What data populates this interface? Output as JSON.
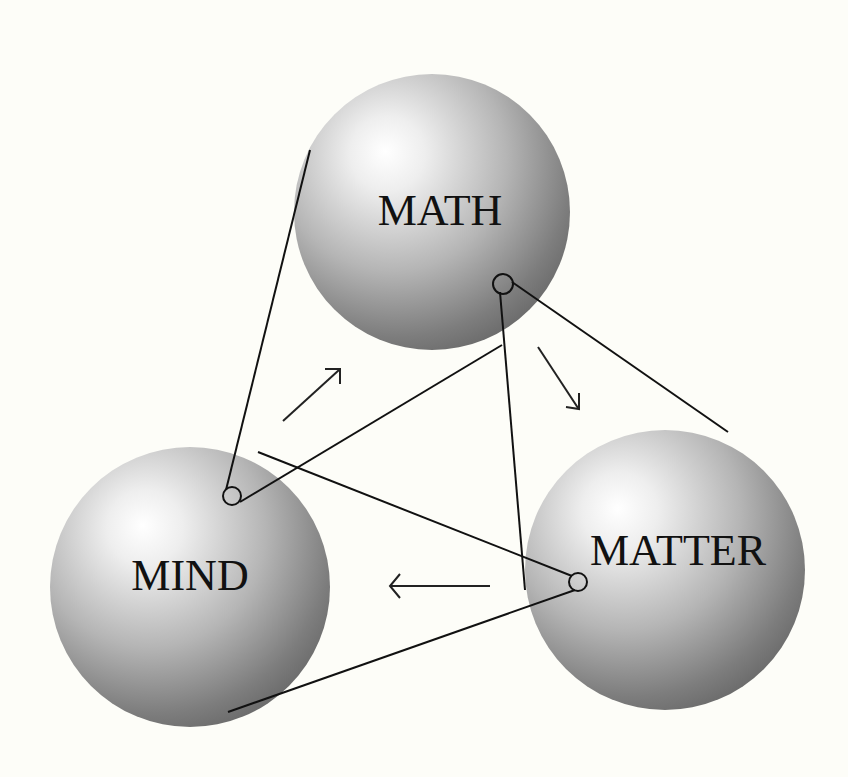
{
  "diagram": {
    "title": "",
    "colors": {
      "background": "#fdfdf8",
      "sphere_highlight": "#ffffff",
      "sphere_mid": "#b8b8b8",
      "sphere_shadow": "#6e6e6e",
      "line": "#111111"
    },
    "nodes": [
      {
        "id": "math",
        "label": "MATH",
        "cx": 432,
        "cy": 212,
        "r": 140,
        "label_x": 440,
        "label_y": 225
      },
      {
        "id": "mind",
        "label": "MIND",
        "cx": 190,
        "cy": 585,
        "r": 140,
        "label_x": 188,
        "label_y": 590
      },
      {
        "id": "matter",
        "label": "MATTER",
        "cx": 665,
        "cy": 570,
        "r": 140,
        "label_x": 678,
        "label_y": 565
      }
    ],
    "flow_arrows": [
      {
        "from": "mind",
        "to": "math",
        "direction": "up-right"
      },
      {
        "from": "math",
        "to": "matter",
        "direction": "down-right"
      },
      {
        "from": "matter",
        "to": "mind",
        "direction": "left"
      }
    ]
  }
}
